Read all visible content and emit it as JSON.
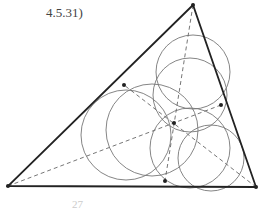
{
  "caption_top": "4.5.31)",
  "caption_bottom": "27",
  "colors": {
    "edge": "#222222",
    "circle": "#777777",
    "median": "#666666",
    "point": "#222222"
  },
  "triangle": {
    "A": [
      193,
      5
    ],
    "B": [
      8,
      186
    ],
    "C": [
      256,
      187
    ]
  },
  "midpoints": {
    "AB": [
      124,
      85
    ],
    "BC": [
      165,
      181
    ],
    "AC": [
      221,
      105
    ]
  },
  "centroid": [
    174,
    123
  ],
  "circles": [
    {
      "cx": 193,
      "cy": 72,
      "r": 37
    },
    {
      "cx": 190,
      "cy": 95,
      "r": 37
    },
    {
      "cx": 126,
      "cy": 135,
      "r": 45
    },
    {
      "cx": 152,
      "cy": 130,
      "r": 46
    },
    {
      "cx": 190,
      "cy": 148,
      "r": 40
    },
    {
      "cx": 211,
      "cy": 158,
      "r": 33
    }
  ]
}
